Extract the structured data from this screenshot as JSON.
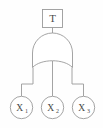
{
  "diagram": {
    "type": "fault-tree",
    "title": "",
    "background_color": "#fefefe",
    "stroke_color": "#9a9a9a",
    "text_color": "#4a4a4a",
    "top_event": {
      "label": "T",
      "shape": "rectangle"
    },
    "gate": {
      "label": "",
      "type": "OR",
      "shape": "or-gate"
    },
    "basic_events": [
      {
        "label": "X",
        "subscript": "1",
        "shape": "circle"
      },
      {
        "label": "X",
        "subscript": "2",
        "shape": "circle"
      },
      {
        "label": "X",
        "subscript": "3",
        "shape": "circle"
      }
    ]
  }
}
